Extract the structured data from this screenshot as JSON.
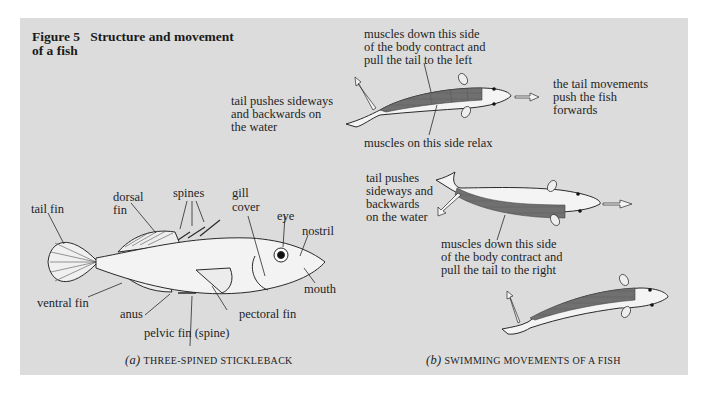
{
  "figure": {
    "number": "Figure 5",
    "title_line1": "Structure and movement",
    "title_line2": "of a fish"
  },
  "part_a": {
    "caption_letter": "(a)",
    "caption_text": "three-spined stickleback",
    "labels": {
      "tail_fin": "tail fin",
      "dorsal_fin_1": "dorsal",
      "dorsal_fin_2": "fin",
      "spines": "spines",
      "gill_cover_1": "gill",
      "gill_cover_2": "cover",
      "eye": "eye",
      "nostril": "nostril",
      "mouth": "mouth",
      "ventral_fin": "ventral fin",
      "anus": "anus",
      "pelvic_fin": "pelvic fin (spine)",
      "pectoral_fin": "pectoral fin"
    }
  },
  "part_b": {
    "caption_letter": "(b)",
    "caption_text": "swimming movements of a fish",
    "top": {
      "muscles_contract_1": "muscles down this side",
      "muscles_contract_2": "of the body contract and",
      "muscles_contract_3": "pull the tail to the left",
      "tail_push_1": "tail pushes sideways",
      "tail_push_2": "and backwards on",
      "tail_push_3": "the water",
      "muscles_relax": "muscles on this side relax",
      "forward_1": "the tail movements",
      "forward_2": "push the fish",
      "forward_3": "forwards"
    },
    "middle": {
      "tail_push_1": "tail pushes",
      "tail_push_2": "sideways and",
      "tail_push_3": "backwards",
      "tail_push_4": "on the water",
      "muscles_contract_1": "muscles down this side",
      "muscles_contract_2": "of the body contract and",
      "muscles_contract_3": "pull the tail to the right"
    }
  },
  "colors": {
    "panel": "#dcdcdc",
    "muscle": "#6e6e6e",
    "fish_body": "#f2f2f2",
    "outline": "#2a2a2a"
  }
}
